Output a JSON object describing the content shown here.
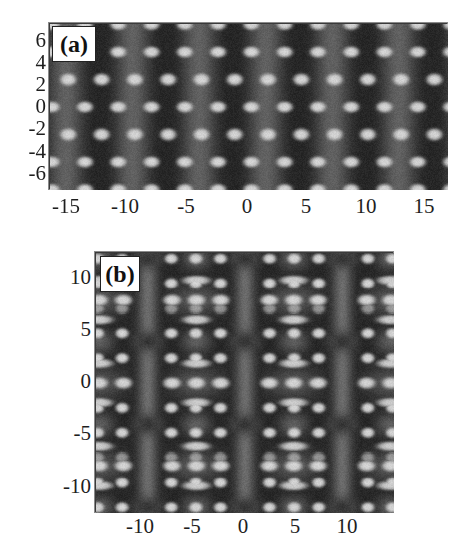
{
  "figure": {
    "panels": [
      {
        "id": "a",
        "label": "(a)",
        "x_ticks": [
          "-15",
          "-10",
          "-5",
          "0",
          "5",
          "10",
          "15"
        ],
        "y_ticks": [
          "6",
          "4",
          "2",
          "0",
          "-2",
          "-4",
          "-6"
        ]
      },
      {
        "id": "b",
        "label": "(b)",
        "x_ticks": [
          "-10",
          "-5",
          "0",
          "5",
          "10"
        ],
        "y_ticks": [
          "10",
          "5",
          "0",
          "-5",
          "-10"
        ]
      }
    ]
  },
  "colors": {
    "dark": "#262626",
    "mid": "#6b6b6b",
    "bright": "#d2d2d2",
    "frame": "#8a8a8a"
  },
  "chart_data": [
    {
      "type": "heatmap",
      "title": "(a)",
      "xlabel": "",
      "ylabel": "",
      "xlim": [
        -16.7,
        16.7
      ],
      "ylim": [
        -7.5,
        7.5
      ],
      "x_ticks": [
        -15,
        -10,
        -5,
        0,
        5,
        10,
        15
      ],
      "y_ticks": [
        6,
        4,
        2,
        0,
        -2,
        -4,
        -6
      ],
      "colormap": "grayscale",
      "description": "Periodic intensity pattern: alternating dark and mid-gray vertical bands with a lattice of bright spots",
      "lattice": {
        "period_x": 5.6,
        "period_y": 5.0,
        "spot_rows_y": [
          5,
          2.5,
          0,
          -2.5,
          -5
        ]
      }
    },
    {
      "type": "heatmap",
      "title": "(b)",
      "xlabel": "",
      "ylabel": "",
      "xlim": [
        -14.5,
        14.5
      ],
      "ylim": [
        -12.5,
        12.5
      ],
      "x_ticks": [
        -10,
        -5,
        0,
        5,
        10
      ],
      "y_ticks": [
        10,
        5,
        0,
        -5,
        -10
      ],
      "colormap": "grayscale",
      "description": "Two-dimensional periodic intensity pattern with bright spot lattice, mid-gray vertical bars at x≈-9.5, 0, 9.5 and dark elliptical regions",
      "lattice": {
        "period_x": 9.5,
        "period_y": 8.0,
        "spot_spacing": 2.4
      }
    }
  ]
}
